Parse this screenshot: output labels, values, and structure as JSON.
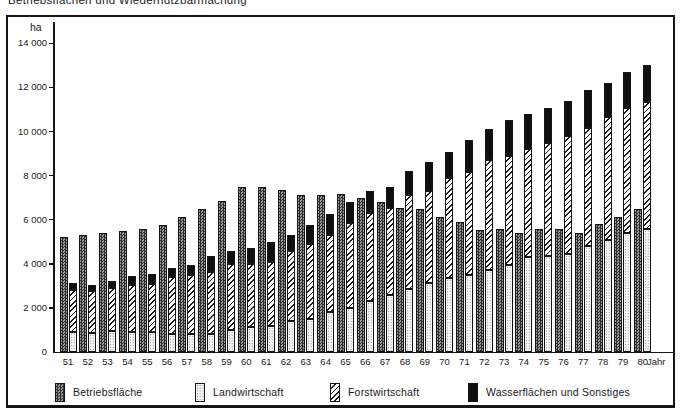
{
  "title": "Betriebsflächen und Wiedernutzbarmachung",
  "axis": {
    "y_unit": "ha",
    "x_unit": "Jahr",
    "yticks": [
      {
        "v": 0,
        "label": "0"
      },
      {
        "v": 2000,
        "label": "2 000"
      },
      {
        "v": 4000,
        "label": "4 000"
      },
      {
        "v": 6000,
        "label": "6 000"
      },
      {
        "v": 8000,
        "label": "8 000"
      },
      {
        "v": 10000,
        "label": "10 000"
      },
      {
        "v": 12000,
        "label": "12 000"
      },
      {
        "v": 14000,
        "label": "14 000"
      }
    ]
  },
  "chart_data": {
    "type": "bar",
    "title": "Betriebsflächen und Wiedernutzbarmachung",
    "xlabel": "Jahr",
    "ylabel": "ha",
    "ylim": [
      0,
      14000
    ],
    "ytick_step": 2000,
    "grid": false,
    "legend_position": "bottom",
    "bar_arrangement": "per year one total bar (Betriebsfläche) beside one stacked bar (Landwirtschaft+Forstwirtschaft+Wasserflächen)",
    "categories": [
      "51",
      "52",
      "53",
      "54",
      "55",
      "56",
      "57",
      "58",
      "59",
      "60",
      "61",
      "62",
      "63",
      "64",
      "65",
      "66",
      "67",
      "68",
      "69",
      "70",
      "71",
      "72",
      "73",
      "74",
      "75",
      "76",
      "77",
      "78",
      "79",
      "80"
    ],
    "series": [
      {
        "name": "Betriebsfläche",
        "role": "standalone",
        "pattern": "dark-crosshatch",
        "values": [
          5200,
          5300,
          5400,
          5500,
          5600,
          5750,
          6100,
          6500,
          6850,
          7500,
          7500,
          7350,
          7100,
          7100,
          7150,
          7000,
          6800,
          6550,
          6500,
          6100,
          5900,
          5550,
          5600,
          5400,
          5600,
          5600,
          5400,
          5800,
          6100,
          6500
        ]
      },
      {
        "name": "Landwirtschaft",
        "role": "stack-bottom",
        "pattern": "light-dots",
        "values": [
          900,
          850,
          950,
          900,
          900,
          800,
          800,
          800,
          1000,
          1150,
          1200,
          1400,
          1500,
          1800,
          2000,
          2300,
          2600,
          2850,
          3150,
          3350,
          3500,
          3700,
          3950,
          4300,
          4350,
          4450,
          4800,
          5100,
          5400,
          5600
        ]
      },
      {
        "name": "Forstwirtschaft",
        "role": "stack-middle",
        "pattern": "diagonal-stripes",
        "values": [
          1900,
          1900,
          1950,
          2150,
          2200,
          2600,
          2700,
          2850,
          3000,
          2850,
          2900,
          3200,
          3400,
          3500,
          3850,
          4000,
          3950,
          4250,
          4150,
          4550,
          4650,
          5000,
          4950,
          4900,
          5150,
          5350,
          5350,
          5550,
          5650,
          5750
        ]
      },
      {
        "name": "Wasserflächen und Sonstiges",
        "role": "stack-top",
        "pattern": "solid-black",
        "values": [
          350,
          300,
          300,
          400,
          450,
          400,
          450,
          700,
          600,
          700,
          900,
          700,
          850,
          950,
          950,
          1000,
          950,
          1100,
          1300,
          1150,
          1450,
          1400,
          1600,
          1600,
          1550,
          1600,
          1750,
          1550,
          1650,
          1650
        ]
      }
    ]
  },
  "colors": {
    "frame": "#151515",
    "text": "#1a1a1a",
    "bar_dark": "#2e2e2e",
    "bar_dark_light": "#9a9a9a",
    "bar_dots_bg": "#f5f5f5",
    "bar_black": "#0f0f0f",
    "background": "#ffffff"
  }
}
